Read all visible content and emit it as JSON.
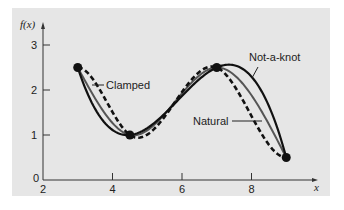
{
  "chart_data": {
    "type": "line",
    "title": "",
    "xlabel": "x",
    "ylabel": "f(x)",
    "xlim": [
      2,
      10
    ],
    "ylim": [
      0,
      3.2
    ],
    "xticks": [
      2,
      4,
      6,
      8
    ],
    "yticks": [
      0,
      1,
      2,
      3
    ],
    "grid": false,
    "data_points": {
      "x": [
        3,
        4.5,
        7,
        9
      ],
      "y": [
        2.5,
        1,
        2.5,
        0.5
      ]
    },
    "series": [
      {
        "name": "Clamped",
        "style": "dashed",
        "end_condition": "clamped (zero end slopes)"
      },
      {
        "name": "Not-a-knot",
        "style": "solid-black",
        "end_condition": "not-a-knot"
      },
      {
        "name": "Natural",
        "style": "solid-gray",
        "end_condition": "natural"
      }
    ],
    "annotations": [
      {
        "text": "Clamped",
        "x": 4.0,
        "y": 2.25
      },
      {
        "text": "Not-a-knot",
        "x": 8.0,
        "y": 2.75
      },
      {
        "text": "Natural",
        "x": 6.5,
        "y": 1.3
      }
    ]
  },
  "labels": {
    "ylabel": "f(x)",
    "xlabel": "x",
    "clamped": "Clamped",
    "notaknot": "Not-a-knot",
    "natural": "Natural",
    "xt": [
      "2",
      "4",
      "6",
      "8"
    ],
    "yt": [
      "0",
      "1",
      "2",
      "3"
    ]
  },
  "colors": {
    "panel": "#e6e6e6",
    "ink": "#111111",
    "natural": "#555555"
  }
}
